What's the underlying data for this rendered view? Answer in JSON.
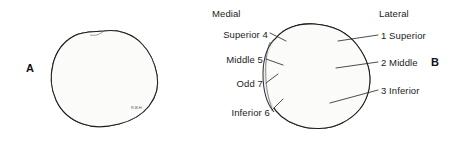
{
  "figure": {
    "background_color": "#ffffff",
    "ink_color": "#1d1d1d"
  },
  "panels": [
    {
      "id": "A",
      "letter": "A",
      "description": "anterior-view-patella"
    },
    {
      "id": "B",
      "letter": "B",
      "description": "posterior-articular-surface-patella"
    }
  ],
  "orientation_labels": {
    "medial": "Medial",
    "lateral": "Lateral"
  },
  "callouts_medial": [
    {
      "key": "superior4",
      "label": "Superior 4"
    },
    {
      "key": "middle5",
      "label": "Middle 5"
    },
    {
      "key": "odd7",
      "label": "Odd 7"
    },
    {
      "key": "inferior6",
      "label": "Inferior 6"
    }
  ],
  "callouts_lateral": [
    {
      "key": "one_superior",
      "label": "1 Superior"
    },
    {
      "key": "two_middle",
      "label": "2 Middle"
    },
    {
      "key": "three_inferior",
      "label": "3 Inferior"
    }
  ],
  "artist_signature": "R.B.H."
}
